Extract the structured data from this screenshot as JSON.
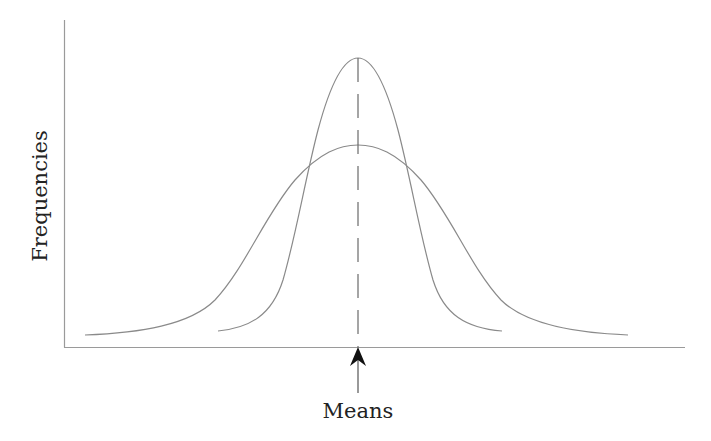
{
  "diagram": {
    "type": "normal-distribution-comparison",
    "y_axis_label": "Frequencies",
    "x_axis_annotation": "Means",
    "colors": {
      "curve": "#8a8a8a",
      "axis": "#9a9a9a",
      "dashed_mean_line": "#6a6a6a",
      "arrow": "#111111",
      "text": "#222222"
    },
    "curves": [
      {
        "name": "narrow-distribution",
        "description": "taller, narrower bell curve (smaller spread)"
      },
      {
        "name": "wide-distribution",
        "description": "shorter, wider bell curve (larger spread)"
      }
    ],
    "shared_mean_marker": "dashed vertical line through both peaks with arrow pointing up at the axis"
  }
}
